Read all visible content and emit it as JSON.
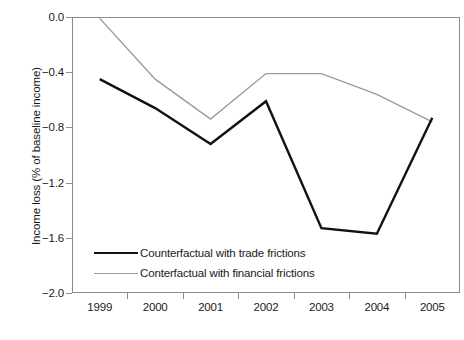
{
  "chart_data": {
    "type": "line",
    "title": "",
    "xlabel": "",
    "ylabel": "Income loss (% of baseline income)",
    "categories": [
      "1999",
      "2000",
      "2001",
      "2002",
      "2003",
      "2004",
      "2005"
    ],
    "ylim": [
      -2.0,
      0.0
    ],
    "yticks": [
      "0.0",
      "−0.4",
      "−0.8",
      "−1.2",
      "−1.6",
      "−2.0"
    ],
    "ytick_values": [
      0.0,
      -0.4,
      -0.8,
      -1.2,
      -1.6,
      -2.0
    ],
    "grid": false,
    "legend_position": "bottom-left",
    "series": [
      {
        "name": "Counterfactual with trade frictions",
        "color": "#121212",
        "width": 2.4,
        "values": [
          -0.45,
          -0.66,
          -0.92,
          -0.61,
          -1.53,
          -1.57,
          -0.73
        ]
      },
      {
        "name": "Conterfactual with financial frictions",
        "color": "#9a9a9a",
        "width": 1.4,
        "values": [
          -0.01,
          -0.45,
          -0.74,
          -0.41,
          -0.41,
          -0.56,
          -0.76
        ]
      }
    ]
  },
  "axis": {
    "frame_color": "#8c8c8c"
  }
}
